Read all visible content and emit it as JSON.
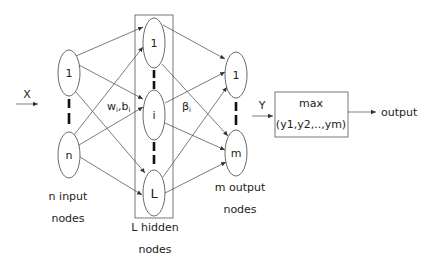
{
  "diagram": {
    "input": {
      "arrow_label": "X",
      "nodes": [
        "1",
        "n"
      ],
      "caption_line1": "n input",
      "caption_line2": "nodes"
    },
    "hidden": {
      "nodes": [
        "1",
        "i",
        "L"
      ],
      "caption_line1": "L  hidden",
      "caption_line2": "nodes",
      "weights_label": "w",
      "weights_sub": "i",
      "bias_label": ",b",
      "bias_sub": "i"
    },
    "output": {
      "nodes": [
        "1",
        "m"
      ],
      "caption_line1": "m output",
      "caption_line2": "nodes",
      "beta_label": "β",
      "beta_sub": "i"
    },
    "max_box": {
      "input_label": "Y",
      "line1": "max",
      "line2": "(y1,y2,..,ym)",
      "output_label": "output"
    }
  }
}
